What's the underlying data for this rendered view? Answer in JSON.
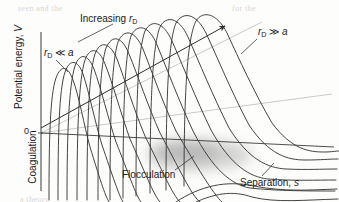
{
  "figure": {
    "axes": {
      "y_label": "Potential energy, V",
      "y_zero_tick": "0",
      "x_label_text": "Separation, s",
      "x_label_prefix": "Separation, ",
      "x_label_symbol": "s"
    },
    "regions": {
      "coagulation": "Coagulation",
      "flocculation": "Flocculation"
    },
    "annotations": {
      "increasing_prefix": "Increasing ",
      "increasing_symbol": "r",
      "increasing_subscript": "D",
      "rd_small_symbol": "r",
      "rd_small_subscript": "D",
      "rd_small_relation": " ≪ ",
      "rd_small_target": "a",
      "rd_large_symbol": "r",
      "rd_large_subscript": "D",
      "rd_large_relation": " ≫ ",
      "rd_large_target": "a"
    },
    "colors": {
      "curve": "#3a3a3a",
      "axis": "#4a4a4a",
      "guide": "#b9b9b9",
      "arrow": "#2e2e2e",
      "shade": "#9d9d9d",
      "text": "#1a1a1a",
      "background": "#fdfdfc"
    }
  },
  "chart_data": {
    "type": "line",
    "xlabel": "Separation, s",
    "ylabel": "Potential energy, V",
    "xlim": [
      0,
      100
    ],
    "ylim": [
      -60,
      100
    ],
    "grid": false,
    "legend": "none",
    "series": [
      {
        "name": "curve-1",
        "r_D": "smallest",
        "barrier_height": 12,
        "barrier_position": 7,
        "tail_level": -46
      },
      {
        "name": "curve-2",
        "r_D": "small",
        "barrier_height": 19,
        "barrier_position": 12,
        "tail_level": -40
      },
      {
        "name": "curve-3",
        "r_D": "small",
        "barrier_height": 26,
        "barrier_position": 17,
        "tail_level": -34
      },
      {
        "name": "curve-4",
        "r_D": "medium",
        "barrier_height": 33,
        "barrier_position": 22,
        "tail_level": -28
      },
      {
        "name": "curve-5",
        "r_D": "medium",
        "barrier_height": 40,
        "barrier_position": 27,
        "tail_level": -22
      },
      {
        "name": "curve-6",
        "r_D": "medium",
        "barrier_height": 47,
        "barrier_position": 32,
        "tail_level": -16
      },
      {
        "name": "curve-7",
        "r_D": "medium",
        "barrier_height": 54,
        "barrier_position": 37,
        "tail_level": -10
      },
      {
        "name": "curve-8",
        "r_D": "large",
        "barrier_height": 61,
        "barrier_position": 42,
        "tail_level": -5
      },
      {
        "name": "curve-9",
        "r_D": "large",
        "barrier_height": 68,
        "barrier_position": 47,
        "tail_level": 0
      },
      {
        "name": "curve-10",
        "r_D": "large",
        "barrier_height": 75,
        "barrier_position": 53,
        "tail_level": 4
      },
      {
        "name": "curve-11",
        "r_D": "larger",
        "barrier_height": 82,
        "barrier_position": 59,
        "tail_level": 8
      },
      {
        "name": "curve-12",
        "r_D": "largest",
        "barrier_height": 90,
        "barrier_position": 66,
        "tail_level": 12
      }
    ],
    "annotations": [
      {
        "text": "Increasing r_D",
        "kind": "arrow",
        "direction": "up-right"
      },
      {
        "text": "r_D << a",
        "kind": "leader",
        "points_to": "leftmost-curve"
      },
      {
        "text": "r_D >> a",
        "kind": "leader",
        "points_to": "rightmost-curve"
      },
      {
        "text": "Coagulation",
        "kind": "region",
        "location": "primary-minimum"
      },
      {
        "text": "Flocculation",
        "kind": "region",
        "location": "secondary-minimum"
      },
      {
        "text": "Separation, s",
        "kind": "axis-label",
        "location": "bottom-right"
      }
    ]
  },
  "background_ghost_text": {
    "line1": "seen and the",
    "line2": "for the",
    "line3": "a theory"
  }
}
